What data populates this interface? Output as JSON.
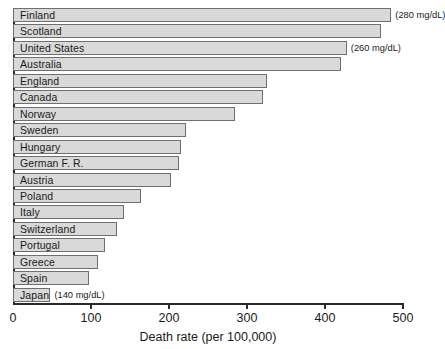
{
  "chart_data": {
    "type": "bar",
    "orientation": "horizontal",
    "title": "",
    "xlabel": "Death rate (per 100,000)",
    "ylabel": "",
    "xlim": [
      0,
      500
    ],
    "x_ticks": [
      0,
      100,
      200,
      300,
      400,
      500
    ],
    "grid": false,
    "legend": "none",
    "categories": [
      "Finland",
      "Scotland",
      "United States",
      "Australia",
      "England",
      "Canada",
      "Norway",
      "Sweden",
      "Hungary",
      "German F. R.",
      "Austria",
      "Poland",
      "Italy",
      "Switzerland",
      "Portugal",
      "Greece",
      "Spain",
      "Japan"
    ],
    "values": [
      485,
      472,
      428,
      420,
      325,
      320,
      285,
      222,
      216,
      213,
      203,
      164,
      142,
      133,
      118,
      109,
      97,
      48
    ],
    "annotations": [
      {
        "category": "Finland",
        "text": "(280 mg/dL)"
      },
      {
        "category": "United States",
        "text": "(260 mg/dL)"
      },
      {
        "category": "Japan",
        "text": "(140 mg/dL)"
      }
    ],
    "bar_fill_color": "#d9d9d9",
    "bar_border_color": "#6f6f6f",
    "axis_color": "#2b2b2b"
  }
}
